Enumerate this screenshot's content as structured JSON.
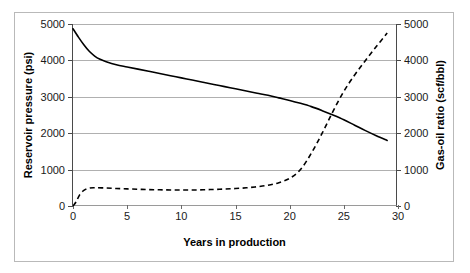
{
  "chart_data": {
    "type": "line",
    "title": "",
    "xlabel": "Years in production",
    "ylabel": "Reservoir pressure (psi)",
    "ylabel_secondary": "Gas-oil ratio (scf/bbl)",
    "xlim": [
      0,
      30
    ],
    "ylim": [
      0,
      5000
    ],
    "ylim_secondary": [
      0,
      5000
    ],
    "grid": true,
    "legend": "none",
    "xticks": [
      0,
      5,
      10,
      15,
      20,
      25,
      30
    ],
    "yticks": [
      0,
      1000,
      2000,
      3000,
      4000,
      5000
    ],
    "yticks_secondary": [
      0,
      1000,
      2000,
      3000,
      4000,
      5000
    ],
    "series": [
      {
        "name": "Reservoir pressure (psi)",
        "axis": "left",
        "style": "solid",
        "color": "#000000",
        "x": [
          0,
          0.5,
          1,
          1.5,
          2,
          2.5,
          3,
          4,
          5,
          6,
          7,
          8,
          9,
          10,
          11,
          12,
          13,
          14,
          15,
          16,
          17,
          18,
          19,
          20,
          21,
          22,
          23,
          24,
          25,
          26,
          27,
          28,
          29
        ],
        "y": [
          4870,
          4640,
          4430,
          4250,
          4120,
          4030,
          3970,
          3880,
          3820,
          3760,
          3700,
          3640,
          3580,
          3520,
          3460,
          3400,
          3340,
          3280,
          3220,
          3160,
          3100,
          3040,
          2970,
          2900,
          2820,
          2730,
          2620,
          2500,
          2370,
          2220,
          2070,
          1930,
          1800
        ]
      },
      {
        "name": "Gas-oil ratio (scf/bbl)",
        "axis": "right",
        "style": "dashed",
        "color": "#000000",
        "x": [
          0,
          0.3,
          0.6,
          1,
          1.5,
          2,
          3,
          4,
          5,
          6,
          7,
          8,
          9,
          10,
          11,
          12,
          13,
          14,
          15,
          16,
          17,
          18,
          19,
          20,
          21,
          22,
          23,
          24,
          25,
          26,
          27,
          28,
          29
        ],
        "y": [
          0,
          120,
          300,
          430,
          490,
          500,
          495,
          480,
          470,
          460,
          450,
          445,
          440,
          440,
          440,
          445,
          455,
          465,
          480,
          500,
          530,
          570,
          640,
          760,
          1000,
          1450,
          2000,
          2600,
          3150,
          3600,
          4000,
          4380,
          4750
        ]
      }
    ]
  },
  "axes": {
    "left_title": "Reservoir pressure (psi)",
    "right_title": "Gas-oil ratio (scf/bbl)",
    "x_title": "Years in production",
    "left_ticks": [
      "5000",
      "4000",
      "3000",
      "2000",
      "1000",
      "0"
    ],
    "right_ticks": [
      "5000",
      "4000",
      "3000",
      "2000",
      "1000",
      "0"
    ],
    "x_ticks": [
      "0",
      "5",
      "10",
      "15",
      "20",
      "25",
      "30"
    ]
  }
}
